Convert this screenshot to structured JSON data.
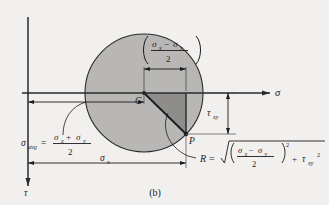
{
  "figure": {
    "caption": "(b)",
    "type": "mohrs-circle-diagram"
  },
  "axes": {
    "horizontal_label": "σ",
    "vertical_label": "τ"
  },
  "labels": {
    "center_point": "C",
    "stress_point": "P",
    "shear_stress": "τ",
    "shear_stress_sub": "xy",
    "sigma_x": "σ",
    "sigma_x_sub": "x",
    "radius_symbol": "R",
    "equals": "="
  },
  "top_bracket": {
    "numerator_left": "σ",
    "numerator_left_sub": "x",
    "minus": "−",
    "numerator_right": "σ",
    "numerator_right_sub": "y",
    "denominator": "2"
  },
  "sigma_avg": {
    "symbol": "σ",
    "symbol_sub": "avg",
    "equals": "=",
    "numerator_left": "σ",
    "numerator_left_sub": "x",
    "plus": "+",
    "numerator_right": "σ",
    "numerator_right_sub": "y",
    "denominator": "2"
  },
  "radius_equation": {
    "symbol": "R",
    "equals": "=",
    "radical": "√",
    "inner_numerator_left": "σ",
    "inner_numerator_left_sub": "x",
    "inner_minus": "−",
    "inner_numerator_right": "σ",
    "inner_numerator_right_sub": "y",
    "inner_denominator": "2",
    "squared": "2",
    "plus": "+",
    "tau": "τ",
    "tau_sub": "xy",
    "tau_sup": "2"
  },
  "colors": {
    "background": "#f2f0ee",
    "circle_fill": "#b8b7b5",
    "triangle_fill": "#8e8d8b",
    "line": "#1c1c1c",
    "thin_line": "#4a4a4a"
  }
}
